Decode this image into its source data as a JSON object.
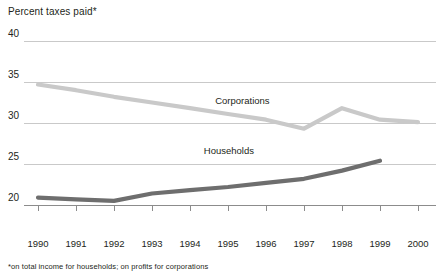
{
  "chart_data": {
    "type": "line",
    "title": "Percent taxes paid*",
    "xlabel": "",
    "ylabel": "Percent taxes paid",
    "footnote": "*on total income for households; on profits for corporations",
    "x": [
      1990,
      1991,
      1992,
      1993,
      1994,
      1995,
      1996,
      1997,
      1998,
      1999,
      2000
    ],
    "xticklabels": [
      "1990",
      "1991",
      "1992",
      "1993",
      "1994",
      "1995",
      "1996",
      "1997",
      "1998",
      "1999",
      "2000"
    ],
    "yticklabels": [
      "40",
      "35",
      "30",
      "25",
      "20"
    ],
    "yticks": [
      40,
      35,
      30,
      25,
      20
    ],
    "ylim": [
      20,
      40
    ],
    "xlim": [
      1990,
      2000
    ],
    "grid": "horizontal",
    "legend": "inline-labels",
    "series": [
      {
        "name": "Corporations",
        "color": "#c9c9c9",
        "values": [
          34.7,
          34.0,
          33.2,
          32.5,
          31.8,
          31.1,
          30.4,
          29.3,
          31.8,
          30.4,
          30.1
        ]
      },
      {
        "name": "Households",
        "color": "#6e6e6e",
        "values": [
          20.9,
          20.7,
          20.5,
          21.4,
          21.8,
          22.2,
          22.7,
          23.2,
          24.2,
          25.4,
          null
        ]
      }
    ],
    "annotations": [
      {
        "text": "Corporations",
        "x": 1995.4,
        "y": 32.6
      },
      {
        "text": "Households",
        "x": 1995.1,
        "y": 26.5
      }
    ]
  },
  "colors": {
    "gridline": "#c9c9c9",
    "axis": "#8c8c8c",
    "corporations": "#c9c9c9",
    "households": "#6e6e6e",
    "text": "#231f20",
    "background": "#ffffff"
  }
}
